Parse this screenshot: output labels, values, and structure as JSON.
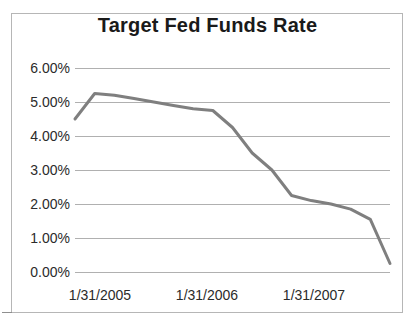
{
  "chart_data": {
    "type": "line",
    "title": "Target Fed Funds Rate",
    "xlabel": "",
    "ylabel": "",
    "grid": true,
    "legend": false,
    "legend_position": "none",
    "line_color": "#7f7f7f",
    "ylim": [
      0,
      6
    ],
    "ytick_labels": [
      "0.00%",
      "1.00%",
      "2.00%",
      "3.00%",
      "4.00%",
      "5.00%",
      "6.00%"
    ],
    "ytick_values": [
      0,
      1,
      2,
      3,
      4,
      5,
      6
    ],
    "xtick_labels": [
      "1/31/2005",
      "1/31/2006",
      "1/31/2007"
    ],
    "xtick_positions": [
      0.08,
      0.42,
      0.76
    ],
    "x": [
      "1/31/2005",
      "4/30/2005",
      "7/31/2005",
      "10/31/2005",
      "1/31/2006",
      "4/30/2006",
      "7/31/2006",
      "10/31/2006",
      "1/31/2007",
      "4/30/2007",
      "7/31/2007",
      "10/31/2007",
      "1/31/2008",
      "4/30/2008",
      "7/31/2008",
      "10/31/2008",
      "12/31/2008"
    ],
    "values": [
      4.5,
      5.25,
      5.2,
      5.1,
      5.0,
      4.9,
      4.8,
      4.75,
      4.25,
      3.5,
      3.0,
      2.25,
      2.1,
      2.0,
      1.85,
      1.55,
      0.25
    ],
    "units": "percent"
  },
  "chart": {
    "title": "Target Fed Funds Rate"
  }
}
